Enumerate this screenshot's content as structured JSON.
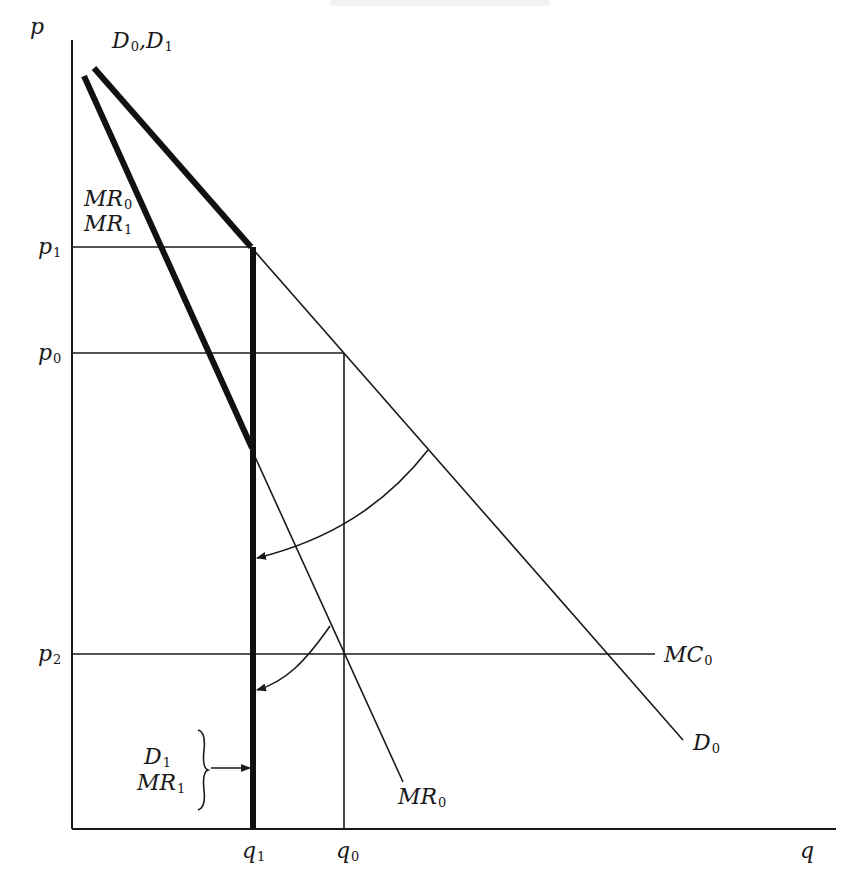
{
  "diagram": {
    "type": "economics-price-quantity",
    "axes": {
      "y_label": "p",
      "x_label": "q"
    },
    "price_levels": [
      {
        "id": "p1",
        "base": "p",
        "sub": "1"
      },
      {
        "id": "p0",
        "base": "p",
        "sub": "0"
      },
      {
        "id": "p2",
        "base": "p",
        "sub": "2"
      }
    ],
    "quantity_levels": [
      {
        "id": "q1",
        "base": "q",
        "sub": "1"
      },
      {
        "id": "q0",
        "base": "q",
        "sub": "0"
      }
    ],
    "curve_labels": {
      "d0_d1": {
        "a": "D",
        "a_sub": "0",
        "sep": ",",
        "b": "D",
        "b_sub": "1"
      },
      "mr0_top": {
        "base": "MR",
        "sub": "0"
      },
      "mr1_top": {
        "base": "MR",
        "sub": "1"
      },
      "mc0": {
        "base": "MC",
        "sub": "0"
      },
      "d0": {
        "base": "D",
        "sub": "0"
      },
      "mr0_bottom": {
        "base": "MR",
        "sub": "0"
      },
      "d1_bracket": {
        "base": "D",
        "sub": "1"
      },
      "mr1_bracket": {
        "base": "MR",
        "sub": "1"
      }
    },
    "colors": {
      "ink": "#1a1a1a",
      "background": "#ffffff"
    }
  }
}
